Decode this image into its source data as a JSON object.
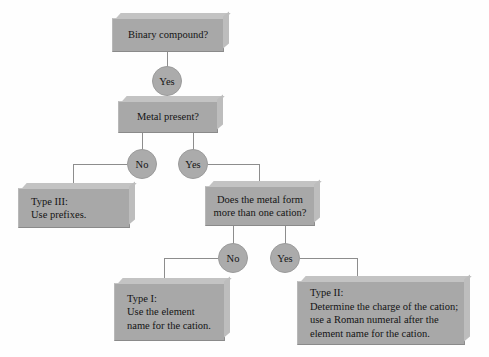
{
  "diagram": {
    "type": "flowchart",
    "background_color": "#fefefe",
    "box_color": "#a8a8a8",
    "node_color": "#ababab",
    "line_color": "#8d8d8d",
    "nodes": {
      "q_binary": {
        "label": "Binary compound?"
      },
      "a_binary_yes": {
        "label": "Yes"
      },
      "q_metal": {
        "label": "Metal present?"
      },
      "a_metal_no": {
        "label": "No"
      },
      "a_metal_yes": {
        "label": "Yes"
      },
      "type3_line1": {
        "label": "Type III:"
      },
      "type3_line2": {
        "label": "Use prefixes."
      },
      "q_cation_line1": {
        "label": "Does the metal form"
      },
      "q_cation_line2": {
        "label": "more than one cation?"
      },
      "a_cation_no": {
        "label": "No"
      },
      "a_cation_yes": {
        "label": "Yes"
      },
      "type1_line1": {
        "label": "Type I:"
      },
      "type1_line2": {
        "label": "Use the element"
      },
      "type1_line3": {
        "label": "name for the cation."
      },
      "type2_line1": {
        "label": "Type II:"
      },
      "type2_line2": {
        "label": "Determine the charge of the cation;"
      },
      "type2_line3": {
        "label": "use a Roman numeral after the"
      },
      "type2_line4": {
        "label": "element name for the cation."
      }
    }
  }
}
